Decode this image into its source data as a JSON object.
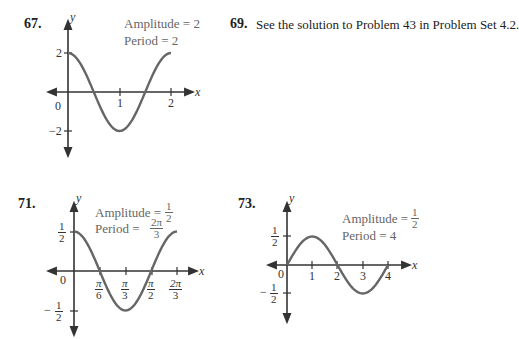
{
  "problems": {
    "p67": {
      "number": "67.",
      "amplitude_label": "Amplitude = 2",
      "period_label": "Period = 2",
      "axis_x": "x",
      "axis_y": "y",
      "origin": "0",
      "x_ticks": [
        "1",
        "2"
      ],
      "y_ticks": [
        "2",
        "−2"
      ]
    },
    "p69": {
      "number": "69.",
      "text": "See the solution to Problem 43 in Problem Set 4.2."
    },
    "p71": {
      "number": "71.",
      "amplitude_label": "Amplitude =",
      "amplitude_num": "1",
      "amplitude_den": "2",
      "period_label": "Period =",
      "period_num": "2π",
      "period_den": "3",
      "axis_x": "x",
      "axis_y": "y",
      "origin": "0",
      "x_ticks": [
        {
          "num": "π",
          "den": "6"
        },
        {
          "num": "π",
          "den": "3"
        },
        {
          "num": "π",
          "den": "2"
        },
        {
          "num": "2π",
          "den": "3"
        }
      ],
      "y_ticks": [
        {
          "sign": "",
          "num": "1",
          "den": "2"
        },
        {
          "sign": "−",
          "num": "1",
          "den": "2"
        }
      ]
    },
    "p73": {
      "number": "73.",
      "amplitude_label": "Amplitude =",
      "amplitude_num": "1",
      "amplitude_den": "2",
      "period_label": "Period = 4",
      "axis_x": "x",
      "axis_y": "y",
      "origin": "0",
      "x_ticks": [
        "1",
        "2",
        "3",
        "4"
      ],
      "y_ticks": [
        {
          "sign": "",
          "num": "1",
          "den": "2"
        },
        {
          "sign": "−",
          "num": "1",
          "den": "2"
        }
      ]
    }
  },
  "chart_data": [
    {
      "type": "line",
      "title": "67. y = 2cos(πx)",
      "xlabel": "x",
      "ylabel": "y",
      "annotations": [
        "Amplitude = 2",
        "Period = 2"
      ],
      "x": [
        0,
        0.5,
        1,
        1.5,
        2
      ],
      "y": [
        2,
        0,
        -2,
        0,
        2
      ],
      "xlim": [
        0,
        2
      ],
      "ylim": [
        -2,
        2
      ],
      "x_tick_labels": [
        "0",
        "1",
        "2"
      ],
      "y_tick_labels": [
        "2",
        "-2"
      ],
      "grid": false
    },
    {
      "type": "line",
      "title": "71. y = (1/2)cos(3x)",
      "xlabel": "x",
      "ylabel": "y",
      "annotations": [
        "Amplitude = 1/2",
        "Period = 2π/3"
      ],
      "x": [
        "0",
        "π/6",
        "π/3",
        "π/2",
        "2π/3"
      ],
      "y": [
        0.5,
        0,
        -0.5,
        0,
        0.5
      ],
      "ylim": [
        -0.5,
        0.5
      ],
      "x_tick_labels": [
        "0",
        "π/6",
        "π/3",
        "π/2",
        "2π/3"
      ],
      "y_tick_labels": [
        "1/2",
        "-1/2"
      ],
      "grid": false
    },
    {
      "type": "line",
      "title": "73. y = (1/2)sin(πx/2)",
      "xlabel": "x",
      "ylabel": "y",
      "annotations": [
        "Amplitude = 1/2",
        "Period = 4"
      ],
      "x": [
        0,
        1,
        2,
        3,
        4
      ],
      "y": [
        0,
        0.5,
        0,
        -0.5,
        0
      ],
      "xlim": [
        0,
        4
      ],
      "ylim": [
        -0.5,
        0.5
      ],
      "x_tick_labels": [
        "0",
        "1",
        "2",
        "3",
        "4"
      ],
      "y_tick_labels": [
        "1/2",
        "-1/2"
      ],
      "grid": false
    }
  ]
}
